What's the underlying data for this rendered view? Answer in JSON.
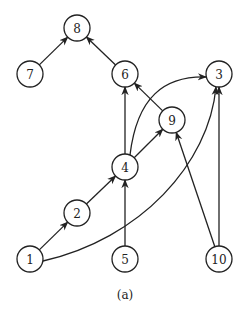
{
  "figure": {
    "caption": "(a)",
    "nodes": [
      {
        "id": "1",
        "label": "1",
        "x": 30,
        "y": 259
      },
      {
        "id": "2",
        "label": "2",
        "x": 77,
        "y": 213
      },
      {
        "id": "3",
        "label": "3",
        "x": 219,
        "y": 74
      },
      {
        "id": "4",
        "label": "4",
        "x": 125,
        "y": 167
      },
      {
        "id": "5",
        "label": "5",
        "x": 125,
        "y": 259
      },
      {
        "id": "6",
        "label": "6",
        "x": 125,
        "y": 74
      },
      {
        "id": "7",
        "label": "7",
        "x": 30,
        "y": 74
      },
      {
        "id": "8",
        "label": "8",
        "x": 77,
        "y": 28
      },
      {
        "id": "9",
        "label": "9",
        "x": 172,
        "y": 120
      },
      {
        "id": "10",
        "label": "10",
        "x": 219,
        "y": 259
      }
    ],
    "edges": [
      {
        "from": "7",
        "to": "8",
        "curve": 0
      },
      {
        "from": "6",
        "to": "8",
        "curve": 0
      },
      {
        "from": "4",
        "to": "6",
        "curve": 0
      },
      {
        "from": "9",
        "to": "6",
        "curve": 0
      },
      {
        "from": "4",
        "to": "9",
        "curve": 0
      },
      {
        "from": "4",
        "to": "3",
        "curve": 1
      },
      {
        "from": "1",
        "to": "3",
        "curve": 2
      },
      {
        "from": "10",
        "to": "3",
        "curve": 0
      },
      {
        "from": "10",
        "to": "9",
        "curve": 0
      },
      {
        "from": "2",
        "to": "4",
        "curve": 0
      },
      {
        "from": "1",
        "to": "2",
        "curve": 0
      },
      {
        "from": "5",
        "to": "4",
        "curve": 0
      }
    ]
  }
}
